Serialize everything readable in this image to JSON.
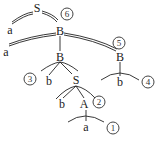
{
  "diagram": {
    "type": "derivation-tree",
    "nodes": [
      {
        "id": "n_S_root",
        "label": "S",
        "x": 37,
        "y": 8
      },
      {
        "id": "n_a1",
        "label": "a",
        "x": 10,
        "y": 30
      },
      {
        "id": "n_B1",
        "label": "B",
        "x": 60,
        "y": 31
      },
      {
        "id": "n_a2",
        "label": "a",
        "x": 6,
        "y": 52
      },
      {
        "id": "n_B2",
        "label": "B",
        "x": 60,
        "y": 57
      },
      {
        "id": "n_B3",
        "label": "B",
        "x": 120,
        "y": 57
      },
      {
        "id": "n_b1",
        "label": "b",
        "x": 49,
        "y": 81
      },
      {
        "id": "n_S2",
        "label": "S",
        "x": 76,
        "y": 80
      },
      {
        "id": "n_b4",
        "label": "b",
        "x": 120,
        "y": 82
      },
      {
        "id": "n_b2",
        "label": "b",
        "x": 62,
        "y": 104
      },
      {
        "id": "n_A",
        "label": "A",
        "x": 84,
        "y": 104
      },
      {
        "id": "n_a3",
        "label": "a",
        "x": 86,
        "y": 127
      }
    ],
    "step_markers": [
      {
        "label": "6",
        "x": 67,
        "y": 14
      },
      {
        "label": "5",
        "x": 119,
        "y": 43
      },
      {
        "label": "3",
        "x": 30,
        "y": 79
      },
      {
        "label": "4",
        "x": 148,
        "y": 82
      },
      {
        "label": "2",
        "x": 99,
        "y": 102
      },
      {
        "label": "1",
        "x": 113,
        "y": 128
      }
    ]
  }
}
